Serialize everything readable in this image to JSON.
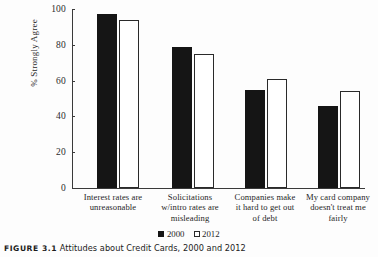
{
  "chart_data": {
    "type": "bar",
    "title": "",
    "xlabel": "",
    "ylabel": "% Strongly Agree",
    "ylim": [
      0,
      100
    ],
    "yticks": [
      0,
      20,
      40,
      60,
      80,
      100
    ],
    "grid": false,
    "legend_position": "bottom-center",
    "categories": [
      "Interest rates are unreasonable",
      "Solicitations w/intro rates are misleading",
      "Companies make it hard to get out of debt",
      "My card company doesn't treat me fairly"
    ],
    "category_lines": [
      [
        "Interest rates are",
        "unreasonable"
      ],
      [
        "Solicitations",
        "w/intro rates are",
        "misleading"
      ],
      [
        "Companies make",
        "it hard to get out",
        "of debt"
      ],
      [
        "My card company",
        "doesn't treat me",
        "fairly"
      ]
    ],
    "series": [
      {
        "name": "2000",
        "color": "#151515",
        "style": "filled",
        "values": [
          97,
          79,
          55,
          46
        ]
      },
      {
        "name": "2012",
        "color": "#ffffff",
        "style": "open",
        "values": [
          94,
          75,
          61,
          54
        ]
      }
    ]
  },
  "axis": {
    "y_title": "% Strongly Agree",
    "tick_labels": [
      "100",
      "80",
      "60",
      "40",
      "20",
      "0"
    ]
  },
  "legend": {
    "items": [
      {
        "label": "2000",
        "swatch": "filled-square-icon"
      },
      {
        "label": "2012",
        "swatch": "open-square-icon"
      }
    ]
  },
  "caption": {
    "label": "FIGURE 3.1",
    "text": "Attitudes about Credit Cards, 2000 and 2012"
  }
}
